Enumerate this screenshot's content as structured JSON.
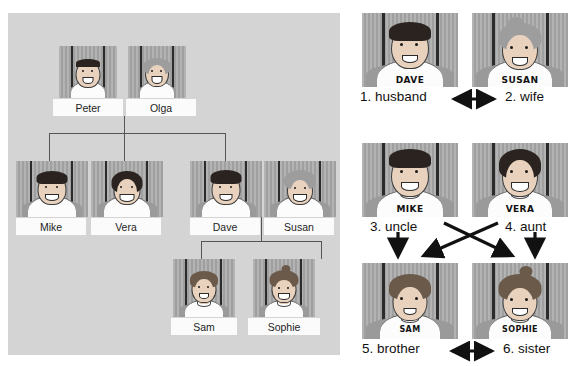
{
  "diagram": {
    "left_panel": {
      "name": "family-tree",
      "generations": [
        {
          "level": 1,
          "people": [
            {
              "id": "peter",
              "label": "Peter",
              "shirt_text": "",
              "hair": "dark-short",
              "gender": "male"
            },
            {
              "id": "olga",
              "label": "Olga",
              "shirt_text": "",
              "hair": "light-curly",
              "gender": "female"
            }
          ]
        },
        {
          "level": 2,
          "people": [
            {
              "id": "mike",
              "label": "Mike",
              "shirt_text": "",
              "hair": "dark-short",
              "gender": "male"
            },
            {
              "id": "vera",
              "label": "Vera",
              "shirt_text": "",
              "hair": "dark-bob",
              "gender": "female"
            },
            {
              "id": "dave",
              "label": "Dave",
              "shirt_text": "",
              "hair": "dark-short",
              "gender": "male"
            },
            {
              "id": "susan",
              "label": "Susan",
              "shirt_text": "",
              "hair": "light-updo",
              "gender": "female"
            }
          ]
        },
        {
          "level": 3,
          "people": [
            {
              "id": "sam",
              "label": "Sam",
              "shirt_text": "",
              "hair": "brown-mop",
              "gender": "male"
            },
            {
              "id": "sophie",
              "label": "Sophie",
              "shirt_text": "",
              "hair": "brown-ponytail",
              "gender": "female"
            }
          ]
        }
      ],
      "connections": [
        {
          "from": "peter-olga",
          "to": [
            "mike",
            "vera",
            "dave"
          ]
        },
        {
          "from": "dave-susan",
          "to": [
            "sam",
            "sophie"
          ]
        }
      ]
    },
    "right_panel": {
      "name": "relation-exercise",
      "pairs": [
        {
          "row": 1,
          "left": {
            "id": "dave",
            "shirt_text": "DAVE",
            "answer": "1. husband",
            "number": "1",
            "word": "husband"
          },
          "right": {
            "id": "susan",
            "shirt_text": "SUSAN",
            "answer": "2. wife",
            "number": "2",
            "word": "wife"
          },
          "arrow": "double-horizontal"
        },
        {
          "row": 2,
          "left": {
            "id": "mike",
            "shirt_text": "MIKE",
            "answer": "3. uncle",
            "number": "3",
            "word": "uncle"
          },
          "right": {
            "id": "vera",
            "shirt_text": "VERA",
            "answer": "4. aunt",
            "number": "4",
            "word": "aunt"
          },
          "arrow": "crossed-down"
        },
        {
          "row": 3,
          "left": {
            "id": "sam",
            "shirt_text": "SAM",
            "answer": "5. brother",
            "number": "5",
            "word": "brother"
          },
          "right": {
            "id": "sophie",
            "shirt_text": "SOPHIE",
            "answer": "6. sister",
            "number": "6",
            "word": "sister"
          },
          "arrow": "double-horizontal"
        }
      ]
    },
    "colors": {
      "panel_background": "#d4d4d4",
      "portrait_background": "#a8a8a8",
      "nameplate_background": "#fbfbfb",
      "line": "#555555",
      "text": "#111111",
      "page_background": "#ffffff"
    }
  }
}
